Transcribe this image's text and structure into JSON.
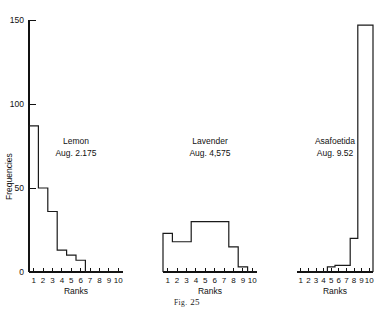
{
  "figure": {
    "caption_prefix": "Fig.",
    "caption_number": "25",
    "caption_full": "Fig. 25"
  },
  "chart_data": {
    "type": "bar",
    "title": "",
    "subtitle": "",
    "xlabel": "Ranks",
    "ylabel": "Frequencies",
    "grid": false,
    "legend_position": "none",
    "ylim": [
      0,
      150
    ],
    "yticks": [
      0,
      50,
      100,
      150
    ],
    "ytick_labels": [
      "0",
      "50",
      "100",
      "150"
    ],
    "categories": [
      1,
      2,
      3,
      4,
      5,
      6,
      7,
      8,
      9,
      10
    ],
    "xtick_labels": [
      "1",
      "2",
      "3",
      "4",
      "5",
      "6",
      "7",
      "8",
      "9",
      "10"
    ],
    "panels": [
      {
        "name": "Lemon",
        "average_label": "Aug. 2.175",
        "average_value": 2.175,
        "values": [
          87,
          50,
          36,
          13,
          10,
          7,
          0,
          0,
          0,
          0
        ]
      },
      {
        "name": "Lavender",
        "average_label": "Aug. 4,575",
        "average_value": 4.575,
        "values": [
          23,
          18,
          18,
          30,
          30,
          30,
          30,
          15,
          3,
          0
        ]
      },
      {
        "name": "Asafoetida",
        "average_label": "Aug. 9.52",
        "average_value": 9.52,
        "values": [
          0,
          0,
          0,
          0,
          3,
          4,
          4,
          20,
          147,
          147
        ]
      }
    ],
    "series": [
      {
        "name": "Lemon",
        "values": [
          87,
          50,
          36,
          13,
          10,
          7,
          0,
          0,
          0,
          0
        ]
      },
      {
        "name": "Lavender",
        "values": [
          23,
          18,
          18,
          30,
          30,
          30,
          30,
          15,
          3,
          0
        ]
      },
      {
        "name": "Asafoetida",
        "values": [
          0,
          0,
          0,
          0,
          3,
          4,
          4,
          20,
          147,
          147
        ]
      }
    ]
  },
  "colors": {
    "ink": "#111111",
    "background": "#ffffff"
  }
}
